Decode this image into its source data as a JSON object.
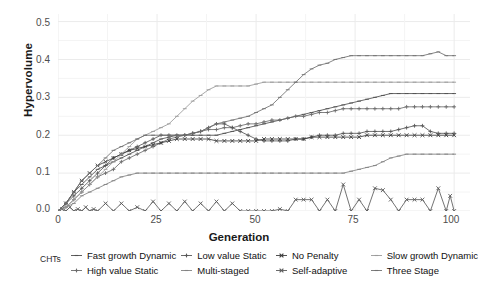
{
  "chart_data": {
    "type": "line",
    "title": "",
    "xlabel": "Generation",
    "ylabel": "Hypervolume",
    "xlim": [
      0,
      104
    ],
    "ylim": [
      0.0,
      0.52
    ],
    "xticks": [
      0,
      25,
      50,
      75,
      100
    ],
    "xtick_labels": [
      "0",
      "25",
      "50",
      "75",
      "100"
    ],
    "yticks": [
      0.0,
      0.1,
      0.2,
      0.3,
      0.4,
      0.5
    ],
    "ytick_labels": [
      "0.0",
      "0.1",
      "0.2",
      "0.3",
      "0.4",
      "0.5"
    ],
    "grid": true,
    "legend_position": "bottom",
    "legend_title": "CHTs",
    "series": [
      {
        "name": "Fast growth Dynamic",
        "color": "#4f4f4f",
        "marker": "dash",
        "x": [
          0,
          2,
          4,
          6,
          8,
          10,
          12,
          14,
          16,
          18,
          20,
          22,
          24,
          26,
          28,
          30,
          32,
          34,
          36,
          38,
          40,
          42,
          44,
          46,
          48,
          50,
          52,
          54,
          56,
          58,
          60,
          62,
          64,
          66,
          68,
          70,
          72,
          74,
          76,
          78,
          80,
          82,
          84,
          86,
          88,
          90,
          92,
          94,
          96,
          98,
          100
        ],
        "y": [
          0.0,
          0.02,
          0.05,
          0.07,
          0.09,
          0.11,
          0.12,
          0.13,
          0.14,
          0.15,
          0.16,
          0.17,
          0.18,
          0.19,
          0.195,
          0.2,
          0.2,
          0.2,
          0.2,
          0.2,
          0.2,
          0.205,
          0.21,
          0.215,
          0.22,
          0.225,
          0.23,
          0.235,
          0.24,
          0.245,
          0.25,
          0.255,
          0.26,
          0.265,
          0.27,
          0.275,
          0.28,
          0.285,
          0.29,
          0.295,
          0.3,
          0.305,
          0.31,
          0.31,
          0.31,
          0.31,
          0.31,
          0.31,
          0.31,
          0.31,
          0.31
        ]
      },
      {
        "name": "High value Static",
        "color": "#6b6b6b",
        "marker": "plus",
        "x": [
          0,
          2,
          4,
          6,
          8,
          10,
          12,
          14,
          16,
          18,
          20,
          22,
          24,
          26,
          28,
          30,
          32,
          34,
          36,
          38,
          40,
          42,
          44,
          46,
          48,
          50,
          52,
          54,
          56,
          58,
          60,
          62,
          64,
          66,
          68,
          70,
          72,
          74,
          76,
          78,
          80,
          82,
          84,
          86,
          88,
          90,
          92,
          94,
          96,
          98,
          100
        ],
        "y": [
          0.0,
          0.01,
          0.03,
          0.05,
          0.07,
          0.09,
          0.1,
          0.11,
          0.13,
          0.14,
          0.15,
          0.16,
          0.17,
          0.18,
          0.19,
          0.195,
          0.2,
          0.205,
          0.21,
          0.215,
          0.215,
          0.22,
          0.22,
          0.225,
          0.23,
          0.23,
          0.235,
          0.24,
          0.24,
          0.245,
          0.25,
          0.25,
          0.255,
          0.26,
          0.26,
          0.265,
          0.27,
          0.27,
          0.27,
          0.27,
          0.27,
          0.27,
          0.27,
          0.27,
          0.275,
          0.275,
          0.275,
          0.275,
          0.275,
          0.275,
          0.275
        ]
      },
      {
        "name": "Low value Static",
        "color": "#575757",
        "marker": "plus",
        "x": [
          0,
          2,
          4,
          6,
          8,
          10,
          12,
          14,
          16,
          18,
          20,
          22,
          24,
          26,
          28,
          30,
          32,
          34,
          36,
          38,
          40,
          42,
          44,
          46,
          48,
          50,
          52,
          54,
          56,
          58,
          60,
          62,
          64,
          66,
          68,
          70,
          72,
          74,
          76,
          78,
          80,
          82,
          84,
          86,
          88,
          90,
          92,
          94,
          96,
          98,
          100
        ],
        "y": [
          0.0,
          0.02,
          0.04,
          0.06,
          0.08,
          0.1,
          0.12,
          0.14,
          0.15,
          0.16,
          0.17,
          0.18,
          0.19,
          0.2,
          0.2,
          0.2,
          0.2,
          0.205,
          0.21,
          0.22,
          0.23,
          0.23,
          0.22,
          0.21,
          0.2,
          0.19,
          0.185,
          0.185,
          0.185,
          0.185,
          0.19,
          0.19,
          0.195,
          0.2,
          0.2,
          0.2,
          0.205,
          0.205,
          0.205,
          0.21,
          0.21,
          0.21,
          0.21,
          0.215,
          0.22,
          0.225,
          0.225,
          0.21,
          0.205,
          0.205,
          0.205
        ]
      },
      {
        "name": "Multi-staged",
        "color": "#828282",
        "marker": "dash",
        "x": [
          0,
          2,
          4,
          6,
          8,
          10,
          12,
          14,
          16,
          18,
          20,
          22,
          24,
          26,
          28,
          30,
          32,
          34,
          36,
          38,
          40,
          42,
          44,
          46,
          48,
          50,
          52,
          54,
          56,
          58,
          60,
          62,
          64,
          66,
          68,
          70,
          72,
          74,
          76,
          78,
          80,
          82,
          84,
          86,
          88,
          90,
          92,
          94,
          96,
          98,
          100
        ],
        "y": [
          0.0,
          0.01,
          0.02,
          0.04,
          0.05,
          0.06,
          0.07,
          0.08,
          0.09,
          0.095,
          0.1,
          0.1,
          0.1,
          0.1,
          0.1,
          0.1,
          0.1,
          0.1,
          0.1,
          0.1,
          0.1,
          0.1,
          0.1,
          0.1,
          0.1,
          0.1,
          0.1,
          0.1,
          0.1,
          0.1,
          0.1,
          0.1,
          0.1,
          0.1,
          0.1,
          0.1,
          0.1,
          0.105,
          0.11,
          0.115,
          0.12,
          0.13,
          0.14,
          0.145,
          0.15,
          0.15,
          0.15,
          0.15,
          0.15,
          0.15,
          0.15
        ]
      },
      {
        "name": "No Penalty",
        "color": "#3d3d3d",
        "marker": "cross",
        "x": [
          0,
          2,
          4,
          6,
          8,
          10,
          12,
          14,
          16,
          18,
          20,
          22,
          24,
          26,
          28,
          30,
          32,
          34,
          36,
          38,
          40,
          42,
          44,
          46,
          48,
          50,
          52,
          54,
          56,
          58,
          60,
          62,
          64,
          66,
          68,
          70,
          72,
          74,
          76,
          78,
          80,
          82,
          84,
          86,
          88,
          90,
          92,
          94,
          96,
          98,
          100
        ],
        "y": [
          0.0,
          0.02,
          0.05,
          0.08,
          0.1,
          0.12,
          0.13,
          0.14,
          0.15,
          0.16,
          0.165,
          0.17,
          0.175,
          0.18,
          0.185,
          0.19,
          0.19,
          0.19,
          0.19,
          0.19,
          0.185,
          0.185,
          0.185,
          0.185,
          0.185,
          0.185,
          0.19,
          0.19,
          0.19,
          0.19,
          0.19,
          0.19,
          0.195,
          0.195,
          0.195,
          0.195,
          0.195,
          0.195,
          0.195,
          0.2,
          0.2,
          0.2,
          0.2,
          0.2,
          0.2,
          0.2,
          0.2,
          0.2,
          0.2,
          0.2,
          0.2
        ]
      },
      {
        "name": "Self-adaptive",
        "color": "#5a5a5a",
        "marker": "cross",
        "x": [
          0,
          1,
          2,
          3,
          4,
          5,
          6,
          7,
          8,
          9,
          10,
          12,
          14,
          16,
          18,
          20,
          22,
          24,
          26,
          28,
          30,
          32,
          34,
          36,
          38,
          40,
          42,
          44,
          46,
          48,
          50,
          52,
          54,
          56,
          58,
          60,
          62,
          64,
          66,
          68,
          70,
          72,
          74,
          76,
          78,
          80,
          82,
          84,
          86,
          88,
          90,
          92,
          94,
          96,
          98,
          99,
          100
        ],
        "y": [
          0.0,
          0.005,
          0.0,
          0.01,
          0.0,
          0.005,
          0.0,
          0.01,
          0.0,
          0.005,
          0.0,
          0.02,
          0.0,
          0.02,
          0.0,
          0.01,
          0.0,
          0.025,
          0.0,
          0.02,
          0.0,
          0.025,
          0.0,
          0.02,
          0.0,
          0.025,
          0.0,
          0.02,
          0.0,
          0.0,
          0.0,
          0.0,
          0.0,
          0.005,
          0.0,
          0.03,
          0.03,
          0.03,
          0.0,
          0.03,
          0.0,
          0.07,
          0.0,
          0.03,
          0.0,
          0.06,
          0.055,
          0.03,
          0.0,
          0.03,
          0.03,
          0.03,
          0.0,
          0.06,
          0.0,
          0.04,
          0.0
        ]
      },
      {
        "name": "Slow growth Dynamic",
        "color": "#9a9a9a",
        "marker": "dash",
        "x": [
          0,
          2,
          4,
          6,
          8,
          10,
          12,
          14,
          16,
          18,
          20,
          22,
          24,
          26,
          28,
          30,
          32,
          34,
          36,
          38,
          40,
          42,
          44,
          46,
          48,
          50,
          52,
          54,
          56,
          58,
          60,
          62,
          64,
          66,
          68,
          70,
          72,
          74,
          76,
          78,
          80,
          82,
          84,
          86,
          88,
          90,
          92,
          94,
          96,
          98,
          100
        ],
        "y": [
          0.0,
          0.01,
          0.03,
          0.05,
          0.07,
          0.09,
          0.11,
          0.13,
          0.15,
          0.17,
          0.19,
          0.2,
          0.21,
          0.22,
          0.23,
          0.25,
          0.27,
          0.29,
          0.305,
          0.32,
          0.33,
          0.33,
          0.33,
          0.33,
          0.33,
          0.335,
          0.34,
          0.34,
          0.34,
          0.34,
          0.34,
          0.34,
          0.34,
          0.34,
          0.34,
          0.34,
          0.34,
          0.34,
          0.34,
          0.34,
          0.34,
          0.34,
          0.34,
          0.34,
          0.34,
          0.34,
          0.34,
          0.34,
          0.34,
          0.34,
          0.34
        ]
      },
      {
        "name": "Three Stage",
        "color": "#707070",
        "marker": "dash",
        "x": [
          0,
          2,
          4,
          6,
          8,
          10,
          12,
          14,
          16,
          18,
          20,
          22,
          24,
          26,
          28,
          30,
          32,
          34,
          36,
          38,
          40,
          42,
          44,
          46,
          48,
          50,
          52,
          54,
          56,
          58,
          60,
          62,
          64,
          66,
          68,
          70,
          72,
          74,
          76,
          78,
          80,
          82,
          84,
          86,
          88,
          90,
          92,
          94,
          96,
          98,
          100
        ],
        "y": [
          0.0,
          0.02,
          0.05,
          0.08,
          0.1,
          0.12,
          0.14,
          0.16,
          0.17,
          0.18,
          0.19,
          0.2,
          0.2,
          0.2,
          0.2,
          0.2,
          0.2,
          0.205,
          0.21,
          0.22,
          0.23,
          0.235,
          0.24,
          0.245,
          0.25,
          0.26,
          0.27,
          0.28,
          0.3,
          0.32,
          0.34,
          0.36,
          0.375,
          0.385,
          0.39,
          0.4,
          0.405,
          0.41,
          0.41,
          0.41,
          0.41,
          0.41,
          0.41,
          0.41,
          0.41,
          0.41,
          0.41,
          0.415,
          0.42,
          0.41,
          0.41
        ]
      }
    ]
  },
  "axes": {
    "ylabel": "Hypervolume",
    "xlabel": "Generation",
    "ytick_labels": [
      "0.5",
      "0.4",
      "0.3",
      "0.2",
      "0.1",
      "0.0"
    ],
    "xtick_labels": [
      "0",
      "25",
      "50",
      "75",
      "100"
    ]
  },
  "legend": {
    "title": "CHTs",
    "items": [
      {
        "label": "Fast growth Dynamic",
        "marker": "dash",
        "color": "#4f4f4f"
      },
      {
        "label": "High value Static",
        "marker": "plus",
        "color": "#6b6b6b"
      },
      {
        "label": "Low value Static",
        "marker": "plus",
        "color": "#575757"
      },
      {
        "label": "Multi-staged",
        "marker": "dash",
        "color": "#828282"
      },
      {
        "label": "No Penalty",
        "marker": "cross",
        "color": "#3d3d3d"
      },
      {
        "label": "Self-adaptive",
        "marker": "cross",
        "color": "#5a5a5a"
      },
      {
        "label": "Slow growth Dynamic",
        "marker": "dash",
        "color": "#9a9a9a"
      },
      {
        "label": "Three Stage",
        "marker": "dash",
        "color": "#707070"
      }
    ]
  },
  "style": {
    "panel_background": "#ffffff",
    "grid_color": "#ebebeb",
    "text_color": "#1a1a1a",
    "tick_color": "#4d4d4d"
  }
}
